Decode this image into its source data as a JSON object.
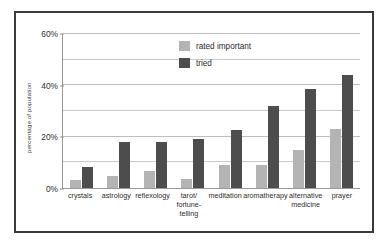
{
  "chart_data": {
    "type": "bar",
    "title": "",
    "xlabel": "",
    "ylabel": "percentage of population",
    "ylim": [
      0,
      60
    ],
    "y_ticks": [
      0,
      20,
      40,
      60
    ],
    "y_tick_labels": [
      "0%",
      "20%",
      "40%",
      "60%"
    ],
    "minor_gridlines": [
      10,
      30,
      50
    ],
    "grid": true,
    "legend_position": "upper center",
    "categories": [
      "crystals",
      "astrology",
      "reflexology",
      "tarot/\nfortune-telling",
      "meditation",
      "aromatherapy",
      "alternative\nmedicine",
      "prayer"
    ],
    "series": [
      {
        "name": "rated important",
        "color": "#b4b4b4",
        "values": [
          3,
          4.5,
          6.5,
          3.5,
          9,
          9,
          15,
          23
        ]
      },
      {
        "name": "tried",
        "color": "#4d4d4d",
        "values": [
          8,
          18,
          18,
          19,
          22.5,
          32,
          38.5,
          44
        ]
      }
    ]
  },
  "legend": {
    "items": [
      {
        "label": "rated important"
      },
      {
        "label": "tried"
      }
    ]
  },
  "colors": {
    "rated_important": "#b4b4b4",
    "tried": "#4d4d4d",
    "frame": "#3a3a3a",
    "gridline": "#c9c9c9",
    "background": "#ffffff"
  }
}
